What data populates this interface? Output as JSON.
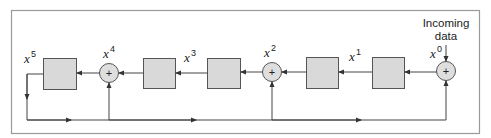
{
  "diagram": {
    "input_label_line1": "Incoming",
    "input_label_line2": "data",
    "labels": {
      "x5": {
        "base": "x",
        "exp": "5"
      },
      "x4": {
        "base": "x",
        "exp": "4"
      },
      "x3": {
        "base": "x",
        "exp": "3"
      },
      "x2": {
        "base": "x",
        "exp": "2"
      },
      "x1": {
        "base": "x",
        "exp": "1"
      },
      "x0": {
        "base": "x",
        "exp": "0"
      }
    },
    "adder_symbol": "+",
    "registers": [
      "reg-1",
      "reg-2",
      "reg-3",
      "reg-4",
      "reg-5"
    ],
    "adders": [
      "x4",
      "x2",
      "x0"
    ],
    "colors": {
      "frame": "#9a9a9a",
      "box_fill": "#d9d9d9",
      "box_stroke": "#555555",
      "circle_fill": "#dedede",
      "line": "#444444"
    }
  }
}
